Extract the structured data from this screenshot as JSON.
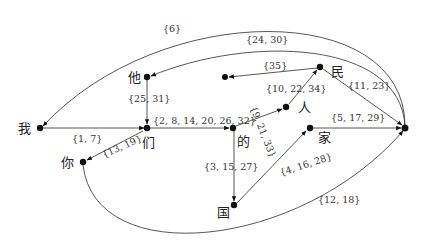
{
  "diagram": {
    "type": "directed-word-graph",
    "nodes": [
      {
        "id": "wo",
        "char": "我"
      },
      {
        "id": "ta",
        "char": "他"
      },
      {
        "id": "men",
        "char": "们"
      },
      {
        "id": "ni",
        "char": "你"
      },
      {
        "id": "de",
        "char": "的"
      },
      {
        "id": "ren",
        "char": "人"
      },
      {
        "id": "min",
        "char": "民"
      },
      {
        "id": "jia",
        "char": "家"
      },
      {
        "id": "guo",
        "char": "国"
      },
      {
        "id": "hub",
        "char": ""
      },
      {
        "id": "loose",
        "char": ""
      }
    ],
    "edges": [
      {
        "from": "wo",
        "to": "men",
        "label": "{1,  7}"
      },
      {
        "from": "ta",
        "to": "men",
        "label": "{25,  31}"
      },
      {
        "from": "men",
        "to": "de",
        "label": "{2, 8, 14, 20, 26, 32}"
      },
      {
        "from": "men",
        "to": "ni",
        "label": "{13,  19}"
      },
      {
        "from": "de",
        "to": "ren",
        "label": "{9, 21, 33}"
      },
      {
        "from": "de",
        "to": "guo",
        "label": "{3, 15, 27}"
      },
      {
        "from": "guo",
        "to": "jia",
        "label": "{4, 16, 28}"
      },
      {
        "from": "jia",
        "to": "hub",
        "label": "{5, 17, 29}"
      },
      {
        "from": "ren",
        "to": "min",
        "label": "{10, 22, 34}"
      },
      {
        "from": "min",
        "to": "hub",
        "label": "{11, 23}"
      },
      {
        "from": "min",
        "to": "loose",
        "label": "{35}"
      },
      {
        "from": "hub",
        "to": "ta",
        "label": "{24, 30}"
      },
      {
        "from": "hub",
        "to": "wo",
        "label": "{6}"
      },
      {
        "from": "ni",
        "to": "hub",
        "label": "{12, 18}"
      }
    ]
  }
}
